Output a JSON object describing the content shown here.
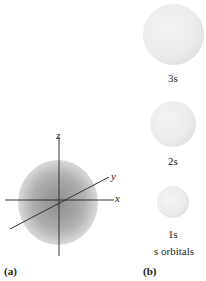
{
  "panel_a": {
    "label": "(a)",
    "axes": {
      "x": "x",
      "y": "y",
      "z": "z"
    }
  },
  "panel_b": {
    "label": "(b)",
    "orbitals": [
      {
        "label": "3s"
      },
      {
        "label": "2s"
      },
      {
        "label": "1s"
      }
    ],
    "caption": "s orbitals"
  }
}
